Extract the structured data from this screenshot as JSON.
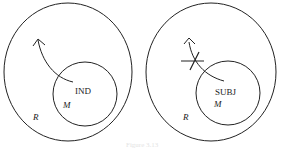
{
  "diagrams": [
    {
      "id": "left",
      "outer_label": "R",
      "inner_label": "M",
      "center_label": "IND",
      "arrow": "exits inner circle (allowed)",
      "blocked": false
    },
    {
      "id": "right",
      "outer_label": "R",
      "inner_label": "M",
      "center_label": "SUBJ",
      "arrow": "exits inner circle (blocked)",
      "blocked": true
    }
  ],
  "caption": "Figure 3.13",
  "colors": {
    "stroke": "#222222",
    "background": "#ffffff"
  }
}
